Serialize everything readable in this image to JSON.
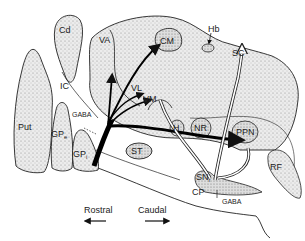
{
  "diagram": {
    "type": "neuroanatomy-sagittal",
    "regions": [
      {
        "id": "cd",
        "label": "Cd"
      },
      {
        "id": "ic",
        "label": "IC"
      },
      {
        "id": "put",
        "label": "Put"
      },
      {
        "id": "gpe",
        "label": "GP",
        "sub": "e"
      },
      {
        "id": "gpi",
        "label": "GP",
        "sub": "i"
      },
      {
        "id": "va",
        "label": "VA"
      },
      {
        "id": "vl",
        "label": "VL"
      },
      {
        "id": "vm",
        "label": "VM"
      },
      {
        "id": "cm",
        "label": "CM"
      },
      {
        "id": "hb",
        "label": "Hb"
      },
      {
        "id": "sc",
        "label": "SC"
      },
      {
        "id": "h",
        "label": "H"
      },
      {
        "id": "nr",
        "label": "NR"
      },
      {
        "id": "ppn",
        "label": "PPN"
      },
      {
        "id": "st",
        "label": "ST"
      },
      {
        "id": "sn",
        "label": "SN",
        "sub": "r"
      },
      {
        "id": "cp",
        "label": "CP"
      },
      {
        "id": "rf",
        "label": "RF"
      }
    ],
    "annotations": {
      "gaba_upper": "GABA",
      "gaba_lower": "GABA"
    },
    "orientation": {
      "rostral": "Rostral",
      "caudal": "Caudal"
    },
    "colors": {
      "stroke": "#222222",
      "fill_stipple": "#d9d9d9",
      "background": "#ffffff"
    }
  }
}
